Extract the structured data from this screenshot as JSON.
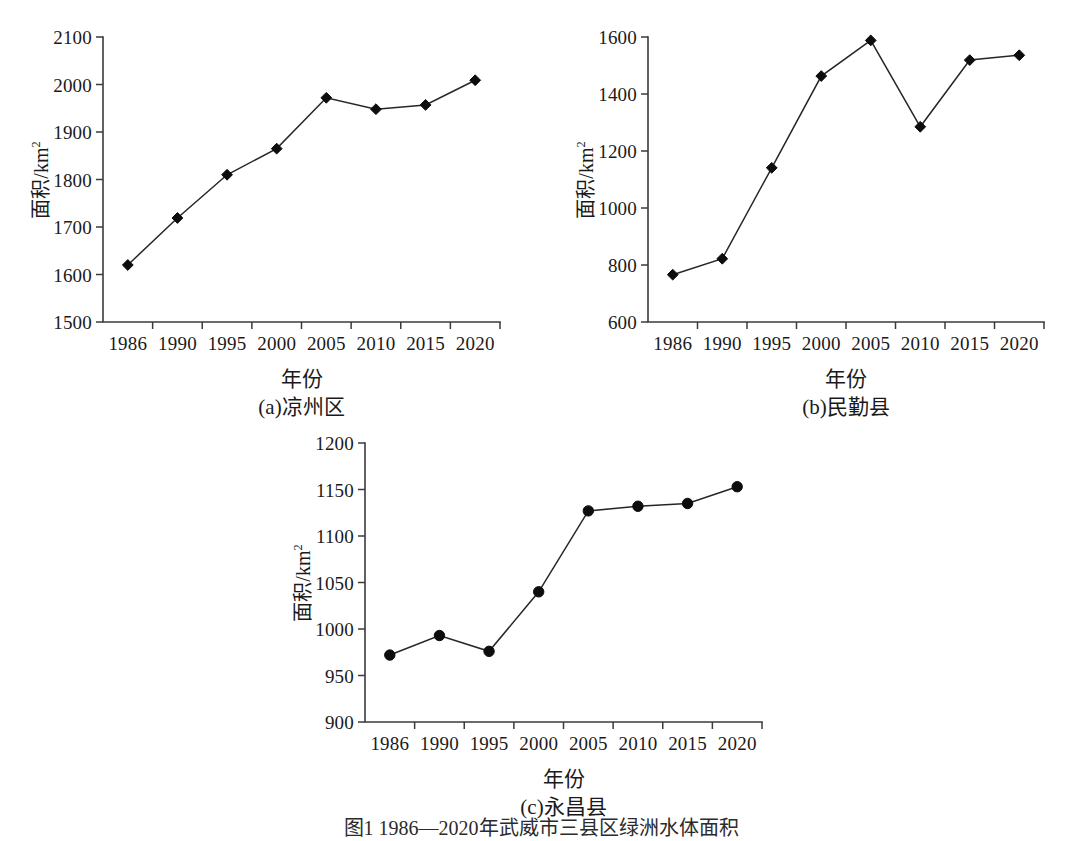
{
  "figure": {
    "caption": "图1  1986—2020年武威市三县区绿洲水体面积",
    "axis_title_y_main": "面积/km",
    "axis_title_y_sup": "2",
    "axis_title_x": "年份",
    "colors": {
      "line": "#262626",
      "marker": "#0d0d0d",
      "axis": "#3b3b3b",
      "background": "#ffffff",
      "text": "#1a1a1a"
    }
  },
  "chart_data": [
    {
      "type": "line",
      "panel": "a",
      "title": "(a)凉州区",
      "xlabel": "年份",
      "ylabel": "面积/km2",
      "marker": "diamond",
      "grid": false,
      "legend": "none",
      "categories": [
        "1986",
        "1990",
        "1995",
        "2000",
        "2005",
        "2010",
        "2015",
        "2020"
      ],
      "values": [
        1620,
        1719,
        1810,
        1865,
        1972,
        1948,
        1957,
        2009
      ],
      "ylim": [
        1500,
        2100
      ],
      "yticks": [
        1500,
        1600,
        1700,
        1800,
        1900,
        2000,
        2100
      ]
    },
    {
      "type": "line",
      "panel": "b",
      "title": "(b)民勤县",
      "xlabel": "年份",
      "ylabel": "面积/km2",
      "marker": "diamond",
      "grid": false,
      "legend": "none",
      "categories": [
        "1986",
        "1990",
        "1995",
        "2000",
        "2005",
        "2010",
        "2015",
        "2020"
      ],
      "values": [
        766,
        822,
        1141,
        1463,
        1588,
        1285,
        1519,
        1536
      ],
      "ylim": [
        600,
        1600
      ],
      "yticks": [
        600,
        800,
        1000,
        1200,
        1400,
        1600
      ]
    },
    {
      "type": "line",
      "panel": "c",
      "title": "(c)永昌县",
      "xlabel": "年份",
      "ylabel": "面积/km2",
      "marker": "circle",
      "grid": false,
      "legend": "none",
      "categories": [
        "1986",
        "1990",
        "1995",
        "2000",
        "2005",
        "2010",
        "2015",
        "2020"
      ],
      "values": [
        972,
        993,
        976,
        1040,
        1127,
        1132,
        1135,
        1153
      ],
      "ylim": [
        900,
        1200
      ],
      "yticks": [
        900,
        950,
        1000,
        1050,
        1100,
        1150,
        1200
      ]
    }
  ]
}
